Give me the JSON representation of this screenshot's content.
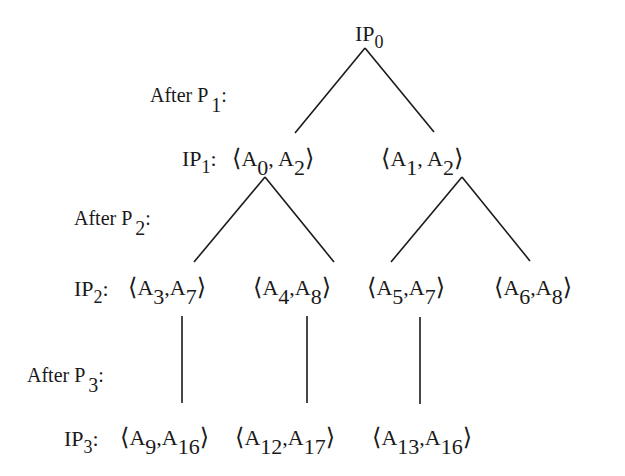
{
  "diagram": {
    "root": {
      "label": "IP",
      "sub": "0"
    },
    "stage_labels": [
      {
        "text": "After  P",
        "sub": "1",
        "suffix": ":"
      },
      {
        "text": "After  P",
        "sub": "2",
        "suffix": ":"
      },
      {
        "text": "After  P",
        "sub": "3",
        "suffix": ":"
      }
    ],
    "level_labels": [
      {
        "label": "IP",
        "sub": "1",
        "suffix": ":"
      },
      {
        "label": "IP",
        "sub": "2",
        "suffix": ":"
      },
      {
        "label": "IP",
        "sub": "3",
        "suffix": ":"
      }
    ],
    "levels": [
      {
        "name": "IP1",
        "nodes": [
          {
            "a": "A",
            "a_sub": "0",
            "b": "A",
            "b_sub": "2"
          },
          {
            "a": "A",
            "a_sub": "1",
            "b": "A",
            "b_sub": "2"
          }
        ]
      },
      {
        "name": "IP2",
        "nodes": [
          {
            "a": "A",
            "a_sub": "3",
            "b": "A",
            "b_sub": "7"
          },
          {
            "a": "A",
            "a_sub": "4",
            "b": "A",
            "b_sub": "8"
          },
          {
            "a": "A",
            "a_sub": "5",
            "b": "A",
            "b_sub": "7"
          },
          {
            "a": "A",
            "a_sub": "6",
            "b": "A",
            "b_sub": "8"
          }
        ]
      },
      {
        "name": "IP3",
        "nodes": [
          {
            "a": "A",
            "a_sub": "9",
            "b": "A",
            "b_sub": "16"
          },
          {
            "a": "A",
            "a_sub": "12",
            "b": "A",
            "b_sub": "17"
          },
          {
            "a": "A",
            "a_sub": "13",
            "b": "A",
            "b_sub": "16"
          }
        ]
      }
    ],
    "glyphs": {
      "open": "⟨",
      "close": "⟩",
      "comma": ","
    },
    "edges": [
      {
        "from": "IP0",
        "to": "<A0,A2>"
      },
      {
        "from": "IP0",
        "to": "<A1,A2>"
      },
      {
        "from": "<A0,A2>",
        "to": "<A3,A7>"
      },
      {
        "from": "<A0,A2>",
        "to": "<A4,A8>"
      },
      {
        "from": "<A1,A2>",
        "to": "<A5,A7>"
      },
      {
        "from": "<A1,A2>",
        "to": "<A6,A8>"
      },
      {
        "from": "<A3,A7>",
        "to": "<A9,A16>"
      },
      {
        "from": "<A4,A8>",
        "to": "<A12,A17>"
      },
      {
        "from": "<A5,A7>",
        "to": "<A13,A16>"
      }
    ],
    "colors": {
      "ink": "#1a1a1a",
      "background": "#ffffff"
    }
  }
}
